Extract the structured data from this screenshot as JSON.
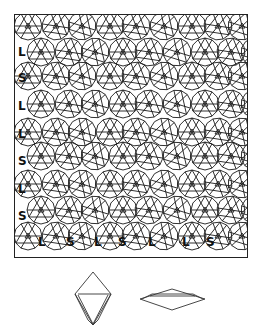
{
  "figure": {
    "left_labels": [
      "L",
      "S",
      "L",
      "L",
      "S",
      "L",
      "S"
    ],
    "bottom_labels": [
      "L",
      "S",
      "L",
      "S",
      "L",
      "L",
      "S"
    ],
    "prototiles": [
      "triangle-over-square rhomb prototile",
      "flat rhombus prototile"
    ],
    "line_color": "#1a1a1a",
    "frame_color": "#222222"
  }
}
